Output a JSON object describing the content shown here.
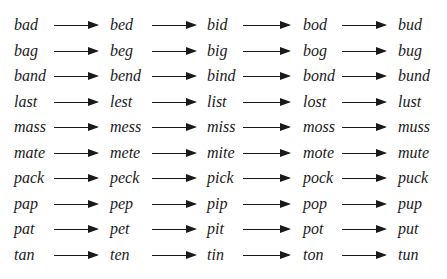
{
  "ladder": {
    "rows": [
      [
        "bad",
        "bed",
        "bid",
        "bod",
        "bud"
      ],
      [
        "bag",
        "beg",
        "big",
        "bog",
        "bug"
      ],
      [
        "band",
        "bend",
        "bind",
        "bond",
        "bund"
      ],
      [
        "last",
        "lest",
        "list",
        "lost",
        "lust"
      ],
      [
        "mass",
        "mess",
        "miss",
        "moss",
        "muss"
      ],
      [
        "mate",
        "mete",
        "mite",
        "mote",
        "mute"
      ],
      [
        "pack",
        "peck",
        "pick",
        "pock",
        "puck"
      ],
      [
        "pap",
        "pep",
        "pip",
        "pop",
        "pup"
      ],
      [
        "pat",
        "pet",
        "pit",
        "pot",
        "put"
      ],
      [
        "tan",
        "ten",
        "tin",
        "ton",
        "tun"
      ]
    ],
    "vowel_sequence": [
      "a",
      "e",
      "i",
      "o",
      "u"
    ],
    "connector_icon": "right-arrow-icon",
    "text_color": "#1a1a1a"
  }
}
